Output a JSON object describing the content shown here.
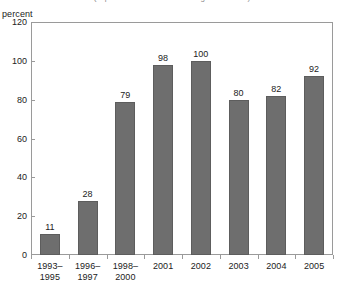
{
  "chart_data": {
    "type": "bar",
    "title": "(in percent of households using the Internet)",
    "ylabel": "percent",
    "xlabel": "",
    "categories": [
      "1993–\n1995",
      "1996–\n1997",
      "1998–\n2000",
      "2001",
      "2002",
      "2003",
      "2004",
      "2005"
    ],
    "category_lines": [
      [
        "1993–",
        "1995"
      ],
      [
        "1996–",
        "1997"
      ],
      [
        "1998–",
        "2000"
      ],
      [
        "2001",
        ""
      ],
      [
        "2002",
        ""
      ],
      [
        "2003",
        ""
      ],
      [
        "2004",
        ""
      ],
      [
        "2005",
        ""
      ]
    ],
    "values": [
      11,
      28,
      79,
      98,
      100,
      80,
      82,
      92
    ],
    "ylim": [
      0,
      120
    ],
    "yticks": [
      0,
      20,
      40,
      60,
      80,
      100,
      120
    ],
    "grid": false,
    "legend": false,
    "bar_color": "#6e6e6e",
    "axis_color": "#9a9a9a",
    "text_color": "#222222"
  }
}
